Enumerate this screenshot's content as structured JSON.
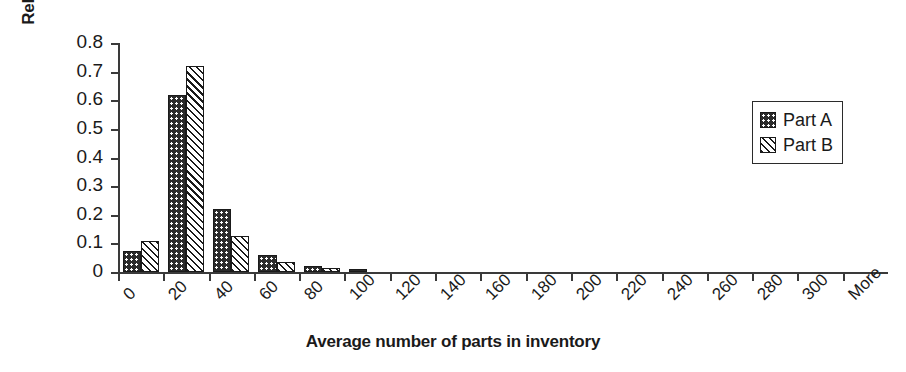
{
  "chart_data": {
    "type": "bar",
    "title": "",
    "xlabel": "Average number of parts in inventory",
    "ylabel": "Relative frequency",
    "categories": [
      "0",
      "20",
      "40",
      "60",
      "80",
      "100",
      "120",
      "140",
      "160",
      "180",
      "200",
      "220",
      "240",
      "260",
      "280",
      "300",
      "More"
    ],
    "xtick_labels": [
      "0",
      "20",
      "40",
      "60",
      "80",
      "100",
      "120",
      "140",
      "160",
      "180",
      "200",
      "220",
      "240",
      "260",
      "280",
      "300",
      "More"
    ],
    "ytick_labels": [
      "0",
      "0.1",
      "0.2",
      "0.3",
      "0.4",
      "0.5",
      "0.6",
      "0.7",
      "0.8"
    ],
    "ytick_values": [
      0,
      0.1,
      0.2,
      0.3,
      0.4,
      0.5,
      0.6,
      0.7,
      0.8
    ],
    "ylim": [
      0,
      0.8
    ],
    "grid": false,
    "legend_position": "upper right",
    "series": [
      {
        "name": "Part A",
        "fill": "dark-dotted",
        "color": "#2b2b2b",
        "values": [
          0.075,
          0.62,
          0.22,
          0.06,
          0.02,
          0.01,
          0,
          0,
          0,
          0,
          0,
          0,
          0,
          0,
          0,
          0,
          0
        ]
      },
      {
        "name": "Part B",
        "fill": "light-diagonal-hatch",
        "color": "#ffffff",
        "values": [
          0.11,
          0.72,
          0.125,
          0.035,
          0.015,
          0,
          0,
          0,
          0,
          0,
          0,
          0,
          0,
          0,
          0,
          0,
          0
        ]
      }
    ]
  },
  "legend": {
    "items": [
      {
        "label": "Part A"
      },
      {
        "label": "Part B"
      }
    ]
  }
}
